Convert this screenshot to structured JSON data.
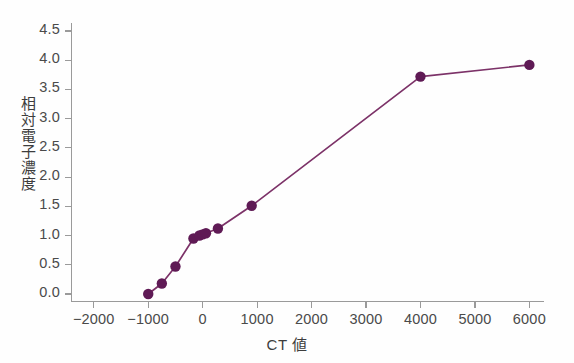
{
  "chart_data": {
    "type": "line",
    "title": "",
    "xlabel": "CT 値",
    "ylabel": "相対電子濃度",
    "xlim": [
      -2400,
      6250
    ],
    "ylim": [
      -0.12,
      4.62
    ],
    "grid": false,
    "legend": null,
    "marker": "circle",
    "line_color": "#7c3268",
    "marker_color": "#5f1a55",
    "axis_color": "#9a9a9a",
    "tick_label_color": "#4a4a4a",
    "xticks": [
      -2000,
      -1000,
      0,
      1000,
      2000,
      3000,
      4000,
      5000,
      6000
    ],
    "xtick_labels": [
      "−2000",
      "−1000",
      "0",
      "1000",
      "2000",
      "3000",
      "4000",
      "5000",
      "6000"
    ],
    "yticks": [
      0.0,
      0.5,
      1.0,
      1.5,
      2.0,
      2.5,
      3.0,
      3.5,
      4.0,
      4.5
    ],
    "ytick_labels": [
      "0.0",
      "0.5",
      "1.0",
      "1.5",
      "2.0",
      "2.5",
      "3.0",
      "3.5",
      "4.0",
      "4.5"
    ],
    "series": [
      {
        "name": "CT-to-relative-electron-density",
        "x": [
          -1000,
          -750,
          -500,
          -170,
          -60,
          0,
          60,
          280,
          900,
          4000,
          6000
        ],
        "values": [
          0.0,
          0.18,
          0.47,
          0.95,
          1.0,
          1.02,
          1.04,
          1.12,
          1.51,
          3.72,
          3.92
        ]
      }
    ]
  }
}
